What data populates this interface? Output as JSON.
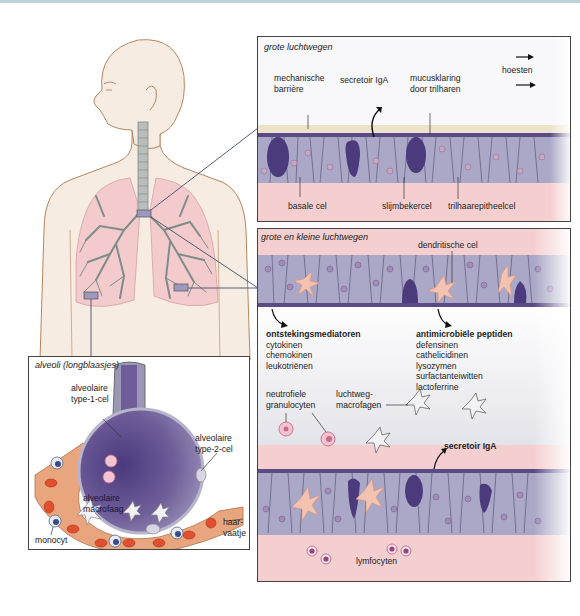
{
  "colors": {
    "skin": "#f6ece2",
    "skin_outline": "#b8855e",
    "lung": "#f3cbcc",
    "bronchi": "#7f8c89",
    "epithelium": "#aaa8c6",
    "epithelium_dark": "#5a4b86",
    "goblet": "#4b3a7c",
    "mucus": "#ece3c8",
    "submucosa": "#f5cfd0",
    "dendritic": "#f3c2b0",
    "alveolus": "#6e5d98",
    "capillary": "#e9a67e",
    "red_cell": "#e0502f",
    "marker": "#9b99bd",
    "topline": "#bcd3dc"
  },
  "panels": {
    "large_airways": {
      "title": "grote luchtwegen",
      "labels": {
        "mechanical_barrier": [
          "mechanische",
          "barrière"
        ],
        "secretory_iga": "secretoir IgA",
        "mucus_clearance": [
          "mucusklaring",
          "door trilharen"
        ],
        "cough": "hoesten",
        "basal_cell": "basale cel",
        "goblet_cell": "slijmbekercel",
        "ciliated_cell": "trilhaarepitheelcel"
      }
    },
    "all_airways": {
      "title": "grote en kleine luchtwegen",
      "labels": {
        "dendritic_cell": "dendritische cel",
        "inflammatory_mediators": {
          "heading": "ontstekingsmediatoren",
          "items": [
            "cytokinen",
            "chemokinen",
            "leukotriënen"
          ]
        },
        "antimicrobial_peptides": {
          "heading": "antimicrobiële peptiden",
          "items": [
            "defensinen",
            "cathelicidinen",
            "lysozymen",
            "surfactanteiwitten",
            "lactoferrine"
          ]
        },
        "neutrophils": [
          "neutrofiele",
          "granulocyten"
        ],
        "airway_macrophages": [
          "luchtweg-",
          "macrofagen"
        ],
        "secretory_iga": "secretoir IgA",
        "lymphocytes": "lymfocyten"
      }
    },
    "alveoli": {
      "title": "alveoli (longblaasjes)",
      "labels": {
        "type1": [
          "alveolaire",
          "type-1-cel"
        ],
        "type2": [
          "alveolaire",
          "type-2-cel"
        ],
        "macrophage": [
          "alveolaire",
          "macrofaag"
        ],
        "monocyte": "monocyt",
        "capillary": [
          "haar-",
          "vaatje"
        ]
      }
    }
  }
}
